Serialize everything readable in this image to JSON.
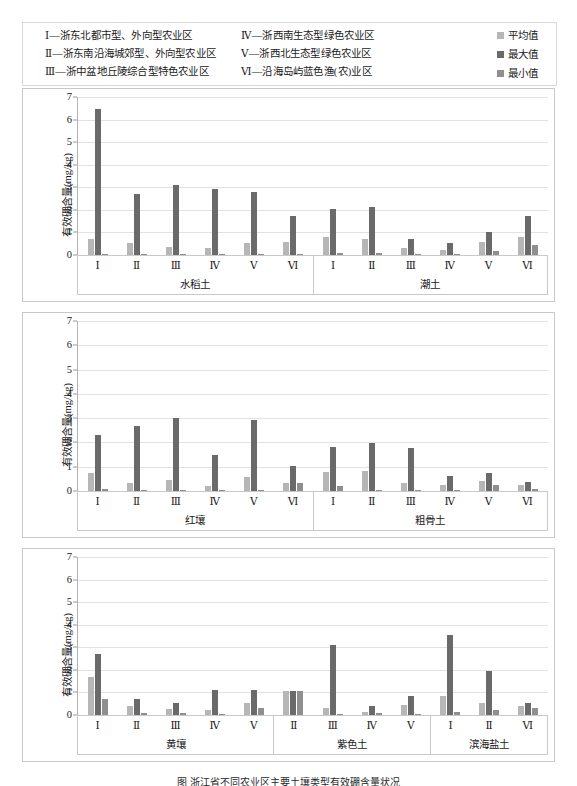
{
  "legend": {
    "regions": [
      "Ⅰ—浙东北都市型、外向型农业区",
      "Ⅳ—浙西南生态型绿色农业区",
      "Ⅱ—浙东南沿海城郊型、外向型农业区",
      "Ⅴ—浙西北生态型绿色农业区",
      "Ⅲ—浙中盆地丘陵综合型特色农业区",
      "Ⅵ—沿海岛屿蓝色渔(农)业区"
    ],
    "series": [
      {
        "label": "平均值",
        "color": "#b6b6b6"
      },
      {
        "label": "最大值",
        "color": "#6a6a6a"
      },
      {
        "label": "最小值",
        "color": "#8f8f8f"
      }
    ]
  },
  "axis": {
    "ylabel": "有效硼含量(mg/kg)",
    "yticks": [
      "7",
      "6",
      "5",
      "4",
      "3",
      "2",
      "1",
      "0"
    ],
    "ymin": 0,
    "ymax": 7
  },
  "caption": "图 浙江省不同农业区主要土壤类型有效硼含量状况",
  "chart_data": [
    {
      "type": "bar",
      "title": "",
      "xlabel": "",
      "ylabel": "有效硼含量(mg/kg)",
      "ylim": [
        0,
        7
      ],
      "grid": true,
      "legend_position": "top-right",
      "series_names": [
        "平均值",
        "最大值",
        "最小值"
      ],
      "groups": [
        {
          "name": "水稻土",
          "categories": [
            "Ⅰ",
            "Ⅱ",
            "Ⅲ",
            "Ⅳ",
            "Ⅴ",
            "Ⅵ"
          ],
          "series": [
            {
              "name": "平均值",
              "values": [
                0.73,
                0.55,
                0.36,
                0.29,
                0.55,
                0.56
              ]
            },
            {
              "name": "最大值",
              "values": [
                6.47,
                2.71,
                3.08,
                2.92,
                2.78,
                1.72
              ]
            },
            {
              "name": "最小值",
              "values": [
                0.06,
                0.05,
                0.05,
                0.05,
                0.06,
                0.06
              ]
            }
          ]
        },
        {
          "name": "潮土",
          "categories": [
            "Ⅰ",
            "Ⅱ",
            "Ⅲ",
            "Ⅳ",
            "Ⅴ",
            "Ⅵ"
          ],
          "series": [
            {
              "name": "平均值",
              "values": [
                0.78,
                0.72,
                0.3,
                0.23,
                0.56,
                0.8
              ]
            },
            {
              "name": "最大值",
              "values": [
                2.05,
                2.13,
                0.71,
                0.52,
                1.03,
                1.74
              ]
            },
            {
              "name": "最小值",
              "values": [
                0.1,
                0.07,
                0.05,
                0.05,
                0.18,
                0.43
              ]
            }
          ]
        }
      ]
    },
    {
      "type": "bar",
      "title": "",
      "xlabel": "",
      "ylabel": "有效硼含量(mg/kg)",
      "ylim": [
        0,
        7
      ],
      "grid": true,
      "series_names": [
        "平均值",
        "最大值",
        "最小值"
      ],
      "groups": [
        {
          "name": "红壤",
          "categories": [
            "Ⅰ",
            "Ⅱ",
            "Ⅲ",
            "Ⅳ",
            "Ⅴ",
            "Ⅵ"
          ],
          "series": [
            {
              "name": "平均值",
              "values": [
                0.73,
                0.34,
                0.44,
                0.21,
                0.56,
                0.33
              ]
            },
            {
              "name": "最大值",
              "values": [
                2.3,
                2.69,
                3.0,
                1.47,
                2.91,
                1.02
              ]
            },
            {
              "name": "最小值",
              "values": [
                0.1,
                0.04,
                0.04,
                0.05,
                0.06,
                0.33
              ]
            }
          ]
        },
        {
          "name": "粗骨土",
          "categories": [
            "Ⅰ",
            "Ⅱ",
            "Ⅲ",
            "Ⅳ",
            "Ⅴ",
            "Ⅵ"
          ],
          "series": [
            {
              "name": "平均值",
              "values": [
                0.8,
                0.84,
                0.32,
                0.23,
                0.42,
                0.26
              ]
            },
            {
              "name": "最大值",
              "values": [
                1.8,
                1.96,
                1.78,
                0.62,
                0.76,
                0.36
              ]
            },
            {
              "name": "最小值",
              "values": [
                0.21,
                0.05,
                0.05,
                0.05,
                0.24,
                0.1
              ]
            }
          ]
        }
      ]
    },
    {
      "type": "bar",
      "title": "",
      "xlabel": "",
      "ylabel": "有效硼含量(mg/kg)",
      "ylim": [
        0,
        7
      ],
      "grid": true,
      "series_names": [
        "平均值",
        "最大值",
        "最小值"
      ],
      "groups": [
        {
          "name": "黄壤",
          "categories": [
            "Ⅰ",
            "Ⅱ",
            "Ⅲ",
            "Ⅳ",
            "Ⅴ"
          ],
          "series": [
            {
              "name": "平均值",
              "values": [
                1.68,
                0.42,
                0.25,
                0.24,
                0.55
              ]
            },
            {
              "name": "最大值",
              "values": [
                2.7,
                0.7,
                0.53,
                1.1,
                1.12
              ]
            },
            {
              "name": "最小值",
              "values": [
                0.72,
                0.09,
                0.07,
                0.05,
                0.33
              ]
            }
          ]
        },
        {
          "name": "紫色土",
          "categories": [
            "Ⅱ",
            "Ⅲ",
            "Ⅳ",
            "Ⅴ"
          ],
          "series": [
            {
              "name": "平均值",
              "values": [
                1.08,
                0.3,
                0.14,
                0.45
              ]
            },
            {
              "name": "最大值",
              "values": [
                1.08,
                3.1,
                0.4,
                0.84
              ]
            },
            {
              "name": "最小值",
              "values": [
                1.08,
                0.05,
                0.07,
                0.06
              ]
            }
          ]
        },
        {
          "name": "滨海盐土",
          "categories": [
            "Ⅰ",
            "Ⅱ",
            "Ⅵ"
          ],
          "series": [
            {
              "name": "平均值",
              "values": [
                0.85,
                0.54,
                0.42
              ]
            },
            {
              "name": "最大值",
              "values": [
                3.56,
                1.93,
                0.53
              ]
            },
            {
              "name": "最小值",
              "values": [
                0.14,
                0.22,
                0.33
              ]
            }
          ]
        }
      ]
    }
  ]
}
